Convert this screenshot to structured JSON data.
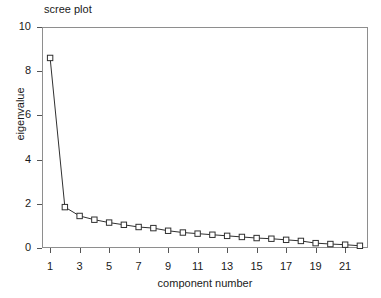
{
  "chart_data": {
    "type": "line",
    "title": "scree plot",
    "xlabel": "component number",
    "ylabel": "eigenvalue",
    "x": [
      1,
      2,
      3,
      4,
      5,
      6,
      7,
      8,
      9,
      10,
      11,
      12,
      13,
      14,
      15,
      16,
      17,
      18,
      19,
      20,
      21,
      22
    ],
    "values": [
      8.6,
      1.85,
      1.45,
      1.28,
      1.15,
      1.05,
      0.95,
      0.9,
      0.78,
      0.7,
      0.65,
      0.6,
      0.55,
      0.5,
      0.45,
      0.42,
      0.37,
      0.32,
      0.22,
      0.18,
      0.15,
      0.1
    ],
    "categories": [
      "1",
      "2",
      "3",
      "4",
      "5",
      "6",
      "7",
      "8",
      "9",
      "10",
      "11",
      "12",
      "13",
      "14",
      "15",
      "16",
      "17",
      "18",
      "19",
      "20",
      "21",
      "22"
    ],
    "xlim": [
      0.45,
      22.55
    ],
    "ylim": [
      0,
      10
    ],
    "xticks": [
      1,
      3,
      5,
      7,
      9,
      11,
      13,
      15,
      17,
      19,
      21
    ],
    "xtick_labels": [
      "1",
      "3",
      "5",
      "7",
      "9",
      "11",
      "13",
      "15",
      "17",
      "19",
      "21"
    ],
    "yticks": [
      0,
      2,
      4,
      6,
      8,
      10
    ],
    "ytick_labels": [
      "0",
      "2",
      "4",
      "6",
      "8",
      "10"
    ],
    "grid": false,
    "legend": null,
    "marker": "open-square",
    "line_color": "#303030",
    "marker_fill": "#ffffff",
    "marker_edge": "#303030",
    "frame_color": "#8e8e8e"
  },
  "caption": {
    "bottom_strip": ""
  }
}
